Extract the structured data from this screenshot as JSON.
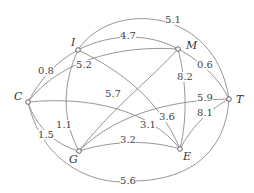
{
  "diagram": {
    "type": "weighted-graph",
    "nodes": [
      {
        "id": "C",
        "label": "C",
        "x": 28,
        "y": 102,
        "lx": 14,
        "ly": 100
      },
      {
        "id": "I",
        "label": "I",
        "x": 78,
        "y": 50,
        "lx": 71,
        "ly": 46
      },
      {
        "id": "M",
        "label": "M",
        "x": 178,
        "y": 49,
        "lx": 186,
        "ly": 49
      },
      {
        "id": "T",
        "label": "T",
        "x": 229,
        "y": 99,
        "lx": 236,
        "ly": 103
      },
      {
        "id": "G",
        "label": "G",
        "x": 79,
        "y": 151,
        "lx": 69,
        "ly": 163
      },
      {
        "id": "E",
        "label": "E",
        "x": 180,
        "y": 149,
        "lx": 183,
        "ly": 160
      }
    ],
    "edges": [
      {
        "from": "I",
        "to": "T",
        "weight": "5.1",
        "path": "M78,50 C110,0 215,5 229,99",
        "lx": 173,
        "ly": 23
      },
      {
        "from": "I",
        "to": "M",
        "weight": "4.7",
        "path": "M78,50 C110,33 150,33 178,49",
        "lx": 128,
        "ly": 39
      },
      {
        "from": "M",
        "to": "T",
        "weight": "0.6",
        "path": "M178,49 C200,60 220,80 229,99",
        "lx": 205,
        "ly": 68
      },
      {
        "from": "C",
        "to": "I",
        "weight": "0.8",
        "path": "M28,102 C40,80 55,62 78,50",
        "lx": 46,
        "ly": 74
      },
      {
        "from": "C",
        "to": "M",
        "weight": "5.2",
        "path": "M28,102 C60,60 120,45 178,49",
        "lx": 84,
        "ly": 68
      },
      {
        "from": "I",
        "to": "G",
        "weight": "1.1",
        "path": "M78,50 C62,85 62,120 79,151",
        "lx": 64,
        "ly": 128
      },
      {
        "from": "I",
        "to": "E",
        "weight": "3.6",
        "path": "M78,50 C120,70 160,100 180,149",
        "lx": 167,
        "ly": 120
      },
      {
        "from": "G",
        "to": "M",
        "weight": "5.7",
        "path": "M79,151 C110,110 150,80 178,49",
        "lx": 113,
        "ly": 97
      },
      {
        "from": "M",
        "to": "E",
        "weight": "8.2",
        "path": "M178,49 C186,80 188,115 180,149",
        "lx": 185,
        "ly": 80
      },
      {
        "from": "C",
        "to": "E",
        "weight": "3.1",
        "path": "M28,102 C90,96 150,110 180,149",
        "lx": 148,
        "ly": 128
      },
      {
        "from": "G",
        "to": "T",
        "weight": "5.9",
        "path": "M79,151 C120,110 180,100 229,99",
        "lx": 205,
        "ly": 101
      },
      {
        "from": "E",
        "to": "T",
        "weight": "8.1",
        "path": "M180,149 C190,130 205,112 229,99",
        "lx": 205,
        "ly": 116
      },
      {
        "from": "C",
        "to": "G",
        "weight": "1.5",
        "path": "M28,102 C35,125 55,145 79,151",
        "lx": 46,
        "ly": 138
      },
      {
        "from": "G",
        "to": "E",
        "weight": "3.2",
        "path": "M79,151 C115,140 150,140 180,149",
        "lx": 128,
        "ly": 143
      },
      {
        "from": "C",
        "to": "T",
        "weight": "5.6",
        "path": "M28,102 C45,175 110,185 128,181 C180,182 225,160 229,99",
        "lx": 128,
        "ly": 184
      }
    ]
  },
  "colors": {
    "edge": "#8a8a8a",
    "node_stroke": "#555555",
    "text": "#444444",
    "background": "#ffffff"
  }
}
